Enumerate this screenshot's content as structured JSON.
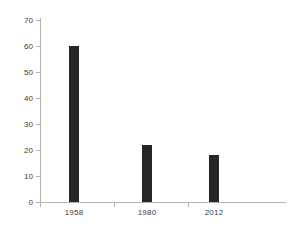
{
  "chart_data": {
    "type": "bar",
    "title": "",
    "subtitle": "",
    "xlabel": "",
    "ylabel": "",
    "categories": [
      "1958",
      "1980",
      "2012"
    ],
    "values": [
      60,
      22,
      18
    ],
    "series": [
      {
        "name": "",
        "values": [
          60,
          22,
          18
        ]
      }
    ],
    "ylim": [
      0,
      70
    ],
    "yticks": [
      0,
      10,
      20,
      30,
      40,
      50,
      60,
      70
    ],
    "ytick_labels": [
      "0",
      "10",
      "20",
      "30",
      "40",
      "50",
      "60",
      "70"
    ],
    "grid": false,
    "legend": null,
    "legend_position": "none",
    "bar_color": "#262626",
    "axis_color": "#b3b3b3",
    "tick_label_color": "#3b3b3b",
    "background_color": "#ffffff",
    "annotations": []
  }
}
